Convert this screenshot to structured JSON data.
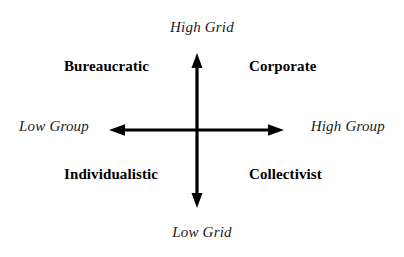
{
  "diagram": {
    "background_color": "#ffffff",
    "line_color": "#000000",
    "axes": {
      "vertical": {
        "name": "Grid",
        "top_label": "High Grid",
        "bottom_label": "Low Grid",
        "x": 197,
        "y_top": 54,
        "y_bottom": 207,
        "arrowheads": "both"
      },
      "horizontal": {
        "name": "Group",
        "left_label": "Low Group",
        "right_label": "High Group",
        "y": 130,
        "x_left": 110,
        "x_right": 283,
        "arrowheads": "both"
      }
    },
    "quadrants": [
      {
        "position": "upper-left",
        "label": "Bureaucratic"
      },
      {
        "position": "upper-right",
        "label": "Corporate"
      },
      {
        "position": "lower-left",
        "label": "Individualistic"
      },
      {
        "position": "lower-right",
        "label": "Collectivist"
      }
    ]
  }
}
